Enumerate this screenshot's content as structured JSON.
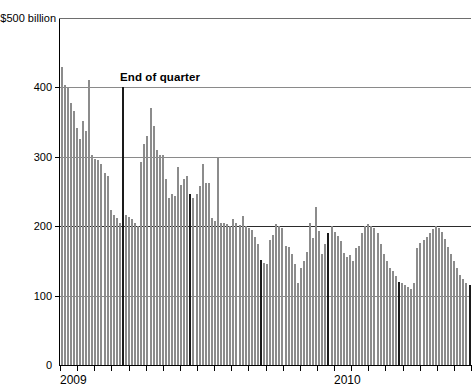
{
  "chart_data": {
    "type": "bar",
    "title": "",
    "subtitle": "",
    "xlabel": "",
    "ylabel": "$500 billion",
    "ylim": [
      0,
      500
    ],
    "grid": true,
    "legend_position": "none",
    "y_ticks": [
      "0",
      "100",
      "200",
      "300",
      "400",
      "$500 billion"
    ],
    "y_tick_values": [
      0,
      100,
      200,
      300,
      400,
      500
    ],
    "x_tick_labels": [
      "2009",
      "2010"
    ],
    "annotations": [
      {
        "text": "End of quarter",
        "x_index": 21,
        "style": "bold-black-bar"
      }
    ],
    "series": [
      {
        "name": "Overnight funding volume",
        "unit": "$ billion",
        "categories": [
          "d1",
          "d2",
          "d3",
          "d4",
          "d5",
          "d6",
          "d7",
          "d8",
          "d9",
          "d10",
          "d11",
          "d12",
          "d13",
          "d14",
          "d15",
          "d16",
          "d17",
          "d18",
          "d19",
          "d20",
          "d21",
          "d22",
          "d23",
          "d24",
          "d25",
          "d26",
          "d27",
          "d28",
          "d29",
          "d30",
          "d31",
          "d32",
          "d33",
          "d34",
          "d35",
          "d36",
          "d37",
          "d38",
          "d39",
          "d40",
          "d41",
          "d42",
          "d43",
          "d44",
          "d45",
          "d46",
          "d47",
          "d48",
          "d49",
          "d50",
          "d51",
          "d52",
          "d53",
          "d54",
          "d55",
          "d56",
          "d57",
          "d58",
          "d59",
          "d60",
          "d61",
          "d62",
          "d63",
          "d64",
          "d65",
          "d66",
          "d67",
          "d68",
          "d69",
          "d70",
          "d71",
          "d72",
          "d73",
          "d74",
          "d75",
          "d76",
          "d77",
          "d78",
          "d79",
          "d80",
          "d81",
          "d82",
          "d83",
          "d84",
          "d85",
          "d86",
          "d87",
          "d88",
          "d89",
          "d90",
          "d91",
          "d92",
          "d93",
          "d94",
          "d95",
          "d96",
          "d97",
          "d98",
          "d99",
          "d100",
          "d101",
          "d102",
          "d103",
          "d104",
          "d105",
          "d106",
          "d107",
          "d108",
          "d109",
          "d110",
          "d111",
          "d112",
          "d113",
          "d114",
          "d115",
          "d116",
          "d117",
          "d118",
          "d119",
          "d120",
          "d121",
          "d122",
          "d123",
          "d124",
          "d125",
          "d126",
          "d127",
          "d128",
          "d129",
          "d130",
          "d131",
          "d132",
          "d133",
          "d134"
        ],
        "values": [
          430,
          403,
          400,
          377,
          366,
          341,
          325,
          352,
          337,
          410,
          302,
          297,
          296,
          290,
          277,
          272,
          223,
          216,
          212,
          205,
          400,
          216,
          213,
          210,
          204,
          200,
          292,
          318,
          330,
          370,
          345,
          310,
          302,
          302,
          268,
          240,
          246,
          243,
          286,
          260,
          268,
          273,
          247,
          240,
          247,
          258,
          290,
          262,
          262,
          212,
          208,
          300,
          205,
          205,
          203,
          200,
          210,
          205,
          202,
          215,
          200,
          197,
          194,
          184,
          175,
          152,
          147,
          145,
          180,
          188,
          203,
          200,
          197,
          172,
          170,
          160,
          145,
          118,
          140,
          150,
          163,
          205,
          183,
          227,
          193,
          160,
          175,
          190,
          200,
          192,
          186,
          178,
          162,
          155,
          158,
          150,
          168,
          172,
          190,
          200,
          203,
          200,
          197,
          190,
          175,
          160,
          150,
          140,
          136,
          128,
          120,
          118,
          115,
          113,
          110,
          118,
          168,
          176,
          180,
          184,
          190,
          196,
          200,
          198,
          192,
          182,
          170,
          160,
          150,
          140,
          130,
          124,
          118,
          115
        ],
        "quarter_end_indices": [
          20,
          42,
          65,
          87,
          110,
          133
        ]
      }
    ]
  },
  "annotation": {
    "end_of_quarter_label": "End of quarter"
  },
  "axis": {
    "y_top_label": "$500 billion",
    "y_400": "400",
    "y_300": "300",
    "y_200": "200",
    "y_100": "100",
    "y_0": "0",
    "x_2009": "2009",
    "x_2010": "2010"
  }
}
